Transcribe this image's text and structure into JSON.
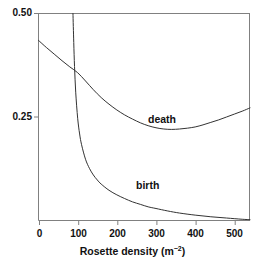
{
  "chart_data": {
    "type": "line",
    "title": "",
    "subtitle": "",
    "xlabel_text": "Rosette density (m",
    "xlabel_sup": "−2",
    "xlabel_tail": ")",
    "xlabel": "Rosette density (m−2)",
    "ylabel": "",
    "xlim": [
      0,
      540
    ],
    "ylim": [
      0,
      0.5
    ],
    "grid": false,
    "legend_position": "inline-annotation",
    "xticks": [
      0,
      100,
      200,
      300,
      400,
      500
    ],
    "xtick_labels": [
      "0",
      "100",
      "200",
      "300",
      "400",
      "500"
    ],
    "yticks": [
      0.25,
      0.5
    ],
    "ytick_labels": [
      "0.25",
      "0.50"
    ],
    "line_color": "#333333",
    "axis_color": "#808080",
    "background": "#ffffff",
    "annotations": [
      {
        "name": "death",
        "text": "death",
        "x": 300,
        "y": 0.255
      },
      {
        "name": "birth",
        "text": "birth",
        "x": 275,
        "y": 0.095
      }
    ],
    "series": [
      {
        "name": "death",
        "label": "death",
        "x": [
          0,
          20,
          40,
          60,
          80,
          100,
          120,
          140,
          160,
          180,
          200,
          220,
          240,
          260,
          280,
          300,
          320,
          340,
          360,
          380,
          400,
          420,
          440,
          460,
          480,
          500,
          520,
          540
        ],
        "values": [
          0.435,
          0.418,
          0.402,
          0.386,
          0.371,
          0.357,
          0.337,
          0.316,
          0.297,
          0.281,
          0.267,
          0.255,
          0.245,
          0.236,
          0.229,
          0.224,
          0.221,
          0.22,
          0.221,
          0.223,
          0.226,
          0.231,
          0.237,
          0.243,
          0.25,
          0.257,
          0.264,
          0.272
        ]
      },
      {
        "name": "birth",
        "label": "birth",
        "x": [
          88,
          90,
          92,
          95,
          100,
          105,
          110,
          120,
          130,
          140,
          150,
          160,
          180,
          200,
          220,
          240,
          260,
          280,
          300,
          330,
          360,
          400,
          440,
          480,
          520,
          540
        ],
        "values": [
          0.5,
          0.43,
          0.372,
          0.31,
          0.247,
          0.209,
          0.183,
          0.148,
          0.126,
          0.11,
          0.098,
          0.088,
          0.073,
          0.062,
          0.053,
          0.045,
          0.039,
          0.033,
          0.029,
          0.023,
          0.018,
          0.013,
          0.009,
          0.006,
          0.003,
          0.002
        ]
      }
    ]
  }
}
